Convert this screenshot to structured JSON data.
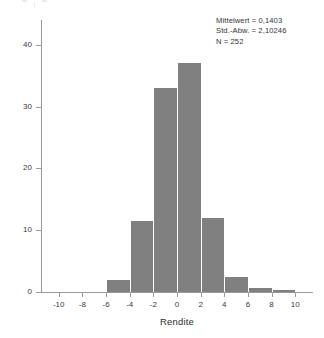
{
  "annotation": {
    "mean_line": "Mittelwert = 0,1403",
    "sd_line": "Std.-Abw. = 2,10246",
    "n_line": "N = 252"
  },
  "colors": {
    "bar_fill": "#808080",
    "axis": "#9a9a9a",
    "text": "#3a3a3a",
    "background": "#ffffff"
  },
  "chart_data": {
    "type": "bar",
    "title": "",
    "subtitle": "",
    "xlabel": "Rendite",
    "ylabel": "",
    "xlim": [
      -11.5,
      11.5
    ],
    "ylim": [
      0,
      44
    ],
    "grid": false,
    "legend": false,
    "legend_position": "none",
    "bin_width": 2,
    "x_ticks": [
      -10,
      -8,
      -6,
      -4,
      -2,
      0,
      2,
      4,
      6,
      8,
      10
    ],
    "x_tick_labels": [
      "-10",
      "-8",
      "-6",
      "-4",
      "-2",
      "0",
      "2",
      "4",
      "6",
      "8",
      "10"
    ],
    "y_ticks": [
      0,
      10,
      20,
      30,
      40
    ],
    "y_tick_labels": [
      "0",
      "10",
      "20",
      "30",
      "40"
    ],
    "bins": [
      {
        "x0": -6,
        "x1": -4,
        "value": 2
      },
      {
        "x0": -4,
        "x1": -2,
        "value": 11.5
      },
      {
        "x0": -2,
        "x1": 0,
        "value": 33
      },
      {
        "x0": 0,
        "x1": 2,
        "value": 37
      },
      {
        "x0": 2,
        "x1": 4,
        "value": 12
      },
      {
        "x0": 4,
        "x1": 6,
        "value": 2.5
      },
      {
        "x0": 6,
        "x1": 8,
        "value": 0.7
      },
      {
        "x0": 8,
        "x1": 10,
        "value": 0.3
      }
    ],
    "categories": [
      "-6..-4",
      "-4..-2",
      "-2..0",
      "0..2",
      "2..4",
      "4..6",
      "6..8",
      "8..10"
    ],
    "values": [
      2,
      11.5,
      33,
      37,
      12,
      2.5,
      0.7,
      0.3
    ],
    "annotations": [
      "Mittelwert = 0,1403",
      "Std.-Abw. = 2,10246",
      "N = 252"
    ],
    "statistics": {
      "mean": 0.1403,
      "std_dev": 2.10246,
      "n": 252
    }
  }
}
